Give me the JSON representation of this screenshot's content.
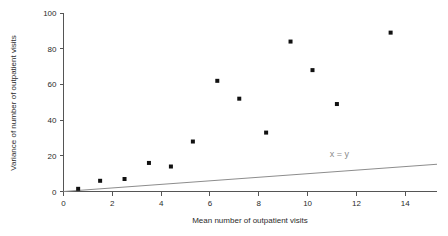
{
  "chart_data": {
    "type": "scatter",
    "title": "",
    "xlabel": "Mean number of outpatient visits",
    "ylabel": "Variance of number of outpatient visits",
    "xlim": [
      0,
      15.3
    ],
    "ylim": [
      0,
      100
    ],
    "xticks": [
      0,
      2,
      4,
      6,
      8,
      10,
      12,
      14
    ],
    "yticks": [
      0,
      20,
      40,
      60,
      80,
      100
    ],
    "grid": false,
    "legend": "none",
    "x": [
      0.6,
      1.5,
      2.5,
      3.5,
      4.4,
      5.3,
      6.3,
      7.2,
      8.3,
      9.3,
      10.2,
      11.2,
      13.4
    ],
    "y": [
      1.5,
      6,
      7,
      16,
      14,
      28,
      62,
      52,
      33,
      84,
      68,
      49,
      89
    ],
    "annotations": [
      {
        "text": "x = y",
        "x": 11.3,
        "y": 19.5
      }
    ],
    "reference_line": {
      "label": "x = y",
      "slope": 1,
      "intercept": 0,
      "x_start": 0,
      "x_end": 15.3
    }
  }
}
